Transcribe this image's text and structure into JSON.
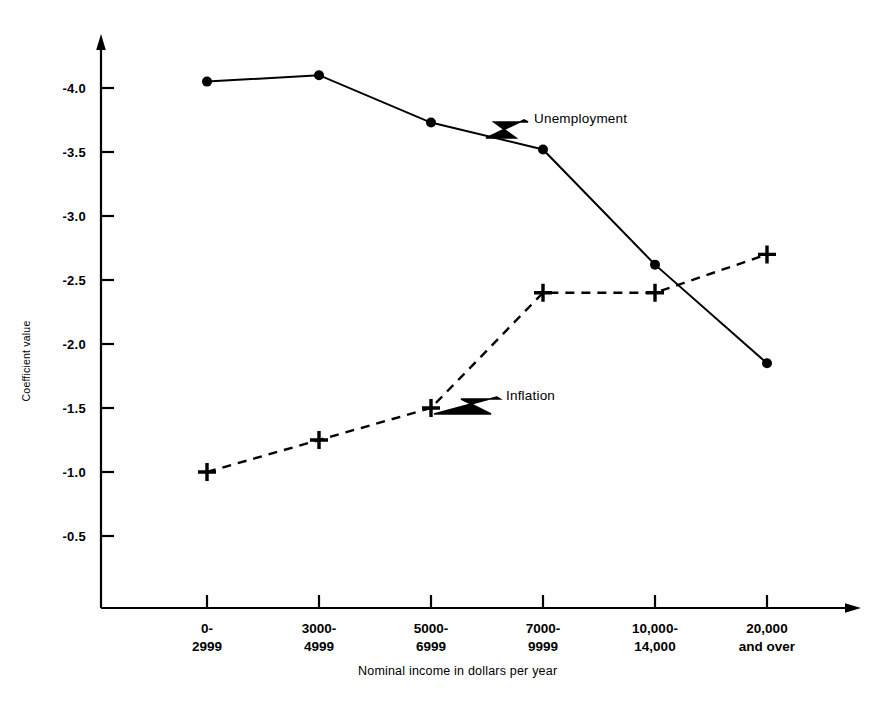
{
  "chart_data": {
    "type": "line",
    "title": "",
    "xlabel": "Nominal income in dollars per year",
    "ylabel": "Coefficient value",
    "categories": [
      "0-\n2999",
      "3000-\n4999",
      "5000-\n6999",
      "7000-\n9999",
      "10,000-\n14,000",
      "20,000\nand over"
    ],
    "ytick_labels": [
      "-4.0",
      "-3.5",
      "-3.0",
      "-2.5",
      "-2.0",
      "-1.5",
      "-1.0",
      "-0.5"
    ],
    "ytick_values": [
      -4.0,
      -3.5,
      -3.0,
      -2.5,
      -2.0,
      -1.5,
      -1.0,
      -0.5
    ],
    "ylim": [
      -4.35,
      0.0
    ],
    "grid": false,
    "legend_position": "inline-annotations",
    "series": [
      {
        "name": "Unemployment",
        "marker": "filled-circle",
        "linestyle": "solid",
        "color": "#000000",
        "values": [
          -4.05,
          -4.1,
          -3.73,
          -3.52,
          -2.62,
          -1.85
        ]
      },
      {
        "name": "Inflation",
        "marker": "plus",
        "linestyle": "dashed",
        "color": "#000000",
        "values": [
          -1.0,
          -1.25,
          -1.5,
          -2.4,
          -2.4,
          -2.7
        ]
      }
    ],
    "annotations": [
      {
        "text": "Unemployment",
        "points_to_series": "Unemployment"
      },
      {
        "text": "Inflation",
        "points_to_series": "Inflation"
      }
    ]
  },
  "axes": {
    "y_axis_name": "coefficient-value-axis",
    "x_axis_name": "nominal-income-axis"
  }
}
